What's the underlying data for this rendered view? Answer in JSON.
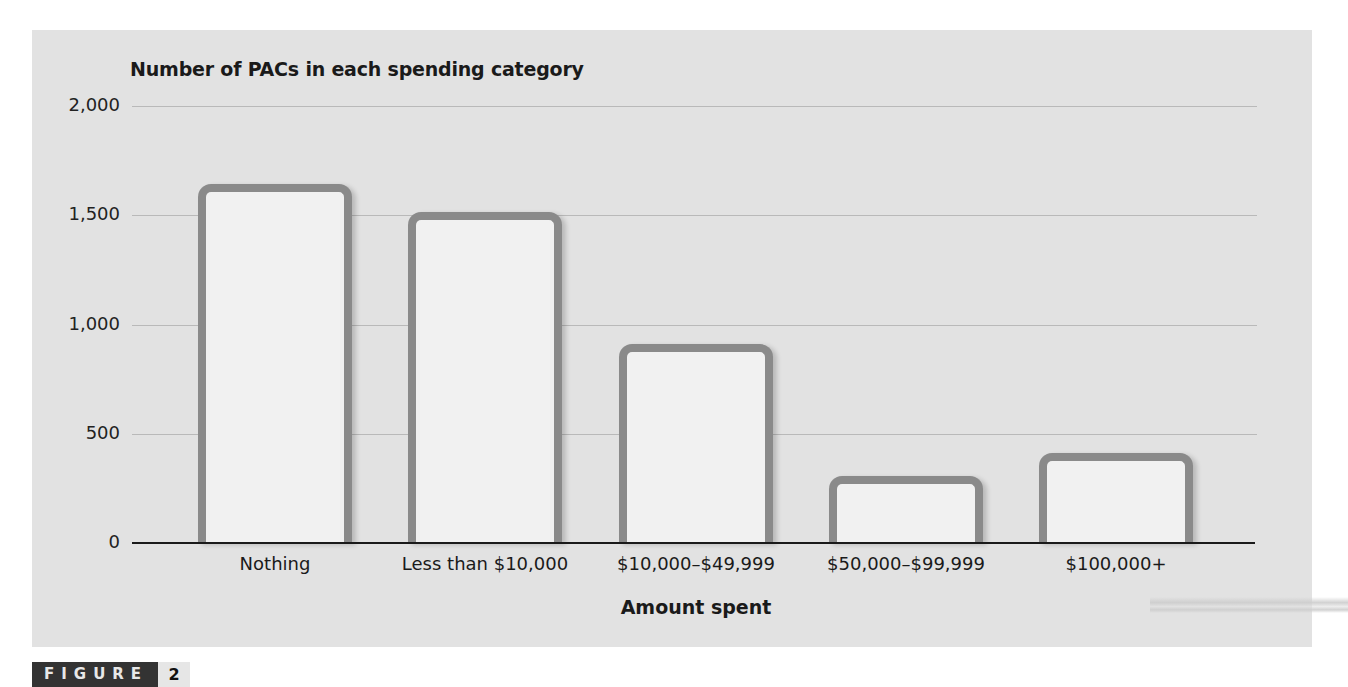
{
  "figure": {
    "word": "FIGURE",
    "number": "2"
  },
  "chart_data": {
    "type": "bar",
    "title": "Number of PACs in each spending category",
    "xlabel": "Amount spent",
    "ylabel": "Number of PACs in each spending category",
    "categories": [
      "Nothing",
      "Less than $10,000",
      "$10,000–$49,999",
      "$50,000–$99,999",
      "$100,000+"
    ],
    "values": [
      1620,
      1490,
      890,
      285,
      390
    ],
    "yticks": [
      0,
      500,
      1000,
      1500,
      2000
    ],
    "ytick_labels": [
      "0",
      "500",
      "1,000",
      "1,500",
      "2,000"
    ],
    "ylim": [
      0,
      2000
    ],
    "grid": true,
    "legend": null,
    "colors": {
      "bar_fill": "#f1f1f1",
      "bar_border": "#8a8a8a",
      "background": "#e2e2e2",
      "grid": "#b9b9b9"
    }
  }
}
